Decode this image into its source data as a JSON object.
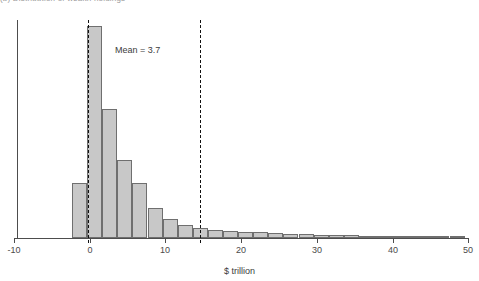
{
  "figure": {
    "clipped_title": "(b) Distribution of wealth holdings",
    "annotation": {
      "mean_label": "Mean = 3.7"
    }
  },
  "chart_data": {
    "type": "bar",
    "title": "(b) Distribution of wealth holdings",
    "xlabel": "$ trillion",
    "ylabel": "",
    "xlim": [
      -10,
      50
    ],
    "ylim": [
      0,
      100
    ],
    "grid": false,
    "legend": null,
    "bin_width": 2,
    "xtick_labels": [
      "-10",
      "0",
      "10",
      "20",
      "30",
      "40",
      "50"
    ],
    "xtick_values": [
      -10,
      0,
      10,
      20,
      30,
      40,
      50
    ],
    "annotations": [
      {
        "text": "Mean = 3.7",
        "x": 3.4,
        "y": 86
      }
    ],
    "reference_lines": [
      {
        "x": -0.3,
        "style": "dashed"
      },
      {
        "x": 14.6,
        "style": "dashed"
      }
    ],
    "bin_centers": [
      -1.4,
      0.6,
      2.6,
      4.6,
      6.6,
      8.6,
      10.6,
      12.6,
      14.6,
      16.6,
      18.6,
      20.6,
      22.6,
      24.6,
      26.6,
      28.6,
      30.6,
      32.6,
      34.6,
      36.6,
      38.6,
      40.6,
      42.6,
      44.6,
      46.6
    ],
    "values": [
      26,
      98,
      61,
      37,
      26,
      14,
      9,
      6,
      5,
      4,
      3,
      3,
      3,
      3,
      2,
      2,
      2,
      2,
      1,
      1,
      1,
      1,
      1,
      1,
      1
    ]
  },
  "bars_px": [
    {
      "x": 72.0,
      "w": 15.1,
      "h": 55
    },
    {
      "x": 87.1,
      "w": 15.1,
      "h": 212
    },
    {
      "x": 102.2,
      "w": 15.1,
      "h": 129
    },
    {
      "x": 117.3,
      "w": 15.1,
      "h": 78
    },
    {
      "x": 132.4,
      "w": 15.1,
      "h": 55
    },
    {
      "x": 147.5,
      "w": 15.1,
      "h": 30
    },
    {
      "x": 162.6,
      "w": 15.1,
      "h": 19
    },
    {
      "x": 177.7,
      "w": 15.1,
      "h": 13
    },
    {
      "x": 192.8,
      "w": 15.1,
      "h": 10
    },
    {
      "x": 207.9,
      "w": 15.1,
      "h": 8
    },
    {
      "x": 223.0,
      "w": 15.1,
      "h": 7
    },
    {
      "x": 238.1,
      "w": 15.1,
      "h": 6
    },
    {
      "x": 253.2,
      "w": 15.1,
      "h": 6
    },
    {
      "x": 268.3,
      "w": 15.1,
      "h": 5
    },
    {
      "x": 283.4,
      "w": 15.1,
      "h": 4
    },
    {
      "x": 298.5,
      "w": 15.1,
      "h": 4
    },
    {
      "x": 313.6,
      "w": 15.1,
      "h": 3
    },
    {
      "x": 328.7,
      "w": 15.1,
      "h": 3
    },
    {
      "x": 343.8,
      "w": 15.1,
      "h": 3
    },
    {
      "x": 358.9,
      "w": 15.1,
      "h": 2
    },
    {
      "x": 374.0,
      "w": 15.1,
      "h": 2
    },
    {
      "x": 389.1,
      "w": 15.1,
      "h": 2
    },
    {
      "x": 404.2,
      "w": 15.1,
      "h": 2
    },
    {
      "x": 419.3,
      "w": 15.1,
      "h": 2
    },
    {
      "x": 434.4,
      "w": 15.1,
      "h": 2
    },
    {
      "x": 449.5,
      "w": 15.1,
      "h": 2
    }
  ],
  "ticks_px": [
    {
      "x": 14,
      "label": "-10"
    },
    {
      "x": 90,
      "label": "0"
    },
    {
      "x": 165,
      "label": "10"
    },
    {
      "x": 241,
      "label": "20"
    },
    {
      "x": 317,
      "label": "30"
    },
    {
      "x": 393,
      "label": "40"
    },
    {
      "x": 468,
      "label": "50"
    }
  ],
  "vlines_px": [
    88,
    200
  ],
  "axis": {
    "xlabel": "$ trillion"
  }
}
